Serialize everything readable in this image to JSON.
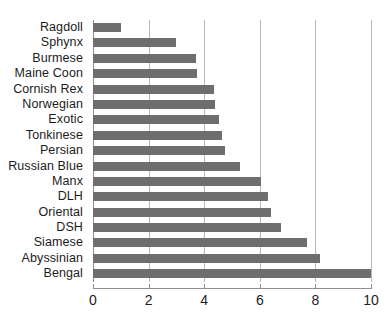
{
  "chart_data": {
    "type": "bar",
    "orientation": "horizontal",
    "title": "",
    "subtitle": "",
    "xlabel": "",
    "ylabel": "",
    "categories": [
      "Ragdoll",
      "Sphynx",
      "Burmese",
      "Maine Coon",
      "Cornish Rex",
      "Norwegian",
      "Exotic",
      "Tonkinese",
      "Persian",
      "Russian Blue",
      "Manx",
      "DLH",
      "Oriental",
      "DSH",
      "Siamese",
      "Abyssinian",
      "Bengal"
    ],
    "values": [
      1.0,
      3.0,
      3.7,
      3.75,
      4.35,
      4.4,
      4.55,
      4.65,
      4.75,
      5.3,
      6.05,
      6.3,
      6.4,
      6.75,
      7.7,
      8.15,
      10.0
    ],
    "xlim": [
      0,
      10
    ],
    "xticks": [
      0,
      2,
      4,
      6,
      8,
      10
    ],
    "xticklabels": [
      "0",
      "2",
      "4",
      "6",
      "8",
      "10"
    ],
    "grid": "vertical",
    "legend": "none",
    "bar_color": "#6e6e6e",
    "gridline_color": "#b9b9b9",
    "axis_color": "#8f8f8f",
    "text_color": "#1c1c1c"
  }
}
